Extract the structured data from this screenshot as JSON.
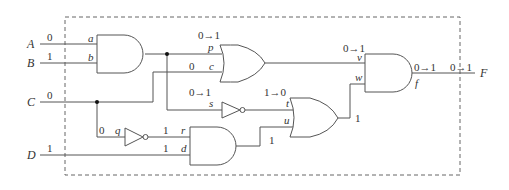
{
  "diagram": {
    "type": "logic-circuit",
    "inputs": [
      {
        "name": "A",
        "value": "0",
        "pin": "a"
      },
      {
        "name": "B",
        "value": "1",
        "pin": "b"
      },
      {
        "name": "C",
        "value": "0"
      },
      {
        "name": "D",
        "value": "1",
        "pin": "d"
      }
    ],
    "output": {
      "name": "F",
      "value": "0→1"
    },
    "gates": [
      {
        "id": "and1",
        "type": "AND",
        "inputs": [
          "a",
          "b"
        ]
      },
      {
        "id": "or1",
        "type": "OR",
        "inputs": [
          "p",
          "c"
        ]
      },
      {
        "id": "not_s",
        "type": "NOT",
        "input": "s"
      },
      {
        "id": "not_q",
        "type": "NOT",
        "input": "q"
      },
      {
        "id": "and2",
        "type": "AND",
        "inputs": [
          "r",
          "d"
        ]
      },
      {
        "id": "or2",
        "type": "OR",
        "inputs": [
          "t",
          "u"
        ]
      },
      {
        "id": "and3",
        "type": "AND",
        "inputs": [
          "v",
          "w"
        ],
        "output": "f"
      }
    ],
    "labels": {
      "A": "A",
      "B": "B",
      "C": "C",
      "D": "D",
      "F": "F",
      "a": "a",
      "b": "b",
      "c": "c",
      "d": "d",
      "f": "f",
      "p": "p",
      "q": "q",
      "r": "r",
      "s": "s",
      "t": "t",
      "u": "u",
      "v": "v",
      "w": "w"
    },
    "values": {
      "A_in": "0",
      "B_in": "1",
      "C_in": "0",
      "D_in": "1",
      "p": "0→1",
      "c": "0",
      "s": "0→1",
      "t": "1→0",
      "q": "0",
      "r": "1",
      "d": "1",
      "u": "1",
      "w": "1",
      "v": "0→1",
      "f": "0→1",
      "F": "0→1"
    }
  }
}
